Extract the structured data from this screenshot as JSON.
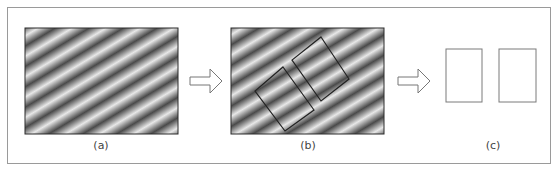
{
  "figure": {
    "panels": [
      {
        "id": "a",
        "label": "(a)",
        "content": "diagonal sinusoidal grating"
      },
      {
        "id": "b",
        "label": "(b)",
        "content": "grating with two rotated rectangular windows aligned to stripes"
      },
      {
        "id": "c",
        "label": "(c)",
        "content": "two extracted upright rectangular patches"
      }
    ],
    "arrows": [
      {
        "from": "a",
        "to": "b"
      },
      {
        "from": "b",
        "to": "c"
      }
    ],
    "colors": {
      "frame": "#9a9a9a",
      "stripe_dark": "#4a4a4a",
      "stripe_light": "#e6e6e6",
      "outline": "#2a2a2a",
      "patch_outline": "#7a7a7a",
      "arrow": "#777777"
    }
  }
}
